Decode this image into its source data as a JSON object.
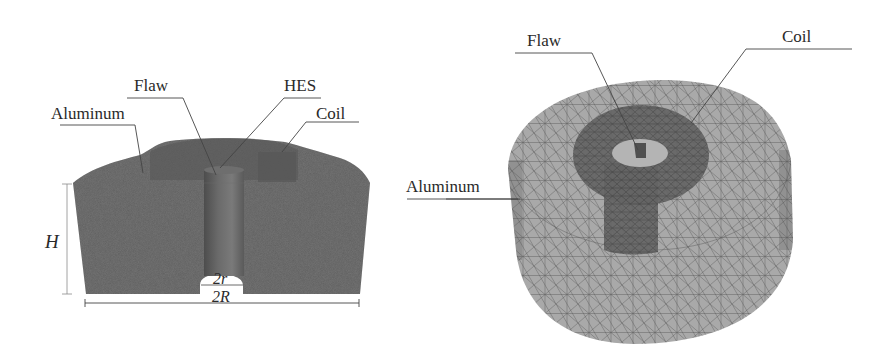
{
  "figure": {
    "left_panel": {
      "title": "Cross-section view",
      "labels": {
        "flaw": "Flaw",
        "hes": "HES",
        "aluminum": "Aluminum",
        "coil": "Coil"
      },
      "dimensions": {
        "height": "H",
        "inner_diameter": "2r",
        "outer_diameter": "2R"
      }
    },
    "right_panel": {
      "title": "3D mesh view",
      "labels": {
        "flaw": "Flaw",
        "coil": "Coil",
        "aluminum": "Aluminum"
      }
    },
    "colors": {
      "solid_fill": "#5f5f5f",
      "solid_dark": "#4a4a4a",
      "flaw_column": "#707070",
      "mesh_fill": "#a8a8a8",
      "mesh_lines": "#555555",
      "coil_dark": "#595959",
      "leader_lines": "#444444",
      "text": "#2a2a2a"
    }
  }
}
